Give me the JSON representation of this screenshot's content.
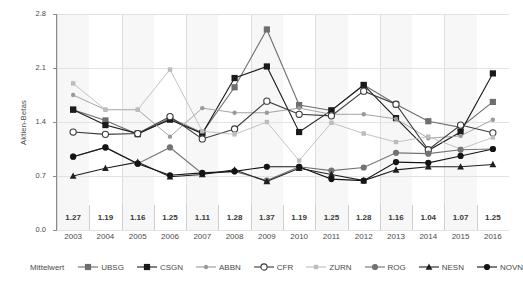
{
  "chart_data": {
    "type": "line",
    "title": "",
    "xlabel": "",
    "ylabel": "Aktien-Betas",
    "ylim": [
      0.0,
      2.8
    ],
    "yticks": [
      "0.0",
      "0.7",
      "1.4",
      "2.1",
      "2.8"
    ],
    "ytick_values": [
      0.0,
      0.7,
      1.4,
      2.1,
      2.8
    ],
    "grid": "horizontal-and-vertical-every-2-years",
    "legend_position": "bottom",
    "categories": [
      "2003",
      "2004",
      "2005",
      "2006",
      "2007",
      "2008",
      "2009",
      "2010",
      "2011",
      "2012",
      "2013",
      "2014",
      "2015",
      "2016"
    ],
    "mean_label": "Mittelwert",
    "mean_values": [
      "1.27",
      "1.19",
      "1.16",
      "1.25",
      "1.11",
      "1.28",
      "1.37",
      "1.19",
      "1.25",
      "1.28",
      "1.16",
      "1.04",
      "1.07",
      "1.25"
    ],
    "series": [
      {
        "name": "UBSG",
        "marker": "square-gray",
        "color": "#6e6e6e",
        "values": [
          1.56,
          1.42,
          1.24,
          1.45,
          1.26,
          1.85,
          2.6,
          1.62,
          1.55,
          1.88,
          1.63,
          1.41,
          1.33,
          1.66
        ]
      },
      {
        "name": "CSGN",
        "marker": "square-black",
        "color": "#1a1a1a",
        "values": [
          1.56,
          1.36,
          1.25,
          1.43,
          1.25,
          1.97,
          2.12,
          1.27,
          1.55,
          1.88,
          1.45,
          1.03,
          1.27,
          2.03
        ]
      },
      {
        "name": "ABBN",
        "marker": "dot-small-gray",
        "color": "#9a9a9a",
        "values": [
          1.75,
          1.56,
          1.56,
          1.21,
          1.58,
          1.52,
          1.52,
          1.58,
          1.5,
          1.5,
          1.44,
          1.19,
          1.22,
          1.43
        ]
      },
      {
        "name": "CFR",
        "marker": "circle-open",
        "color": "#3a3a3a",
        "values": [
          1.27,
          1.24,
          1.25,
          1.47,
          1.18,
          1.31,
          1.67,
          1.5,
          1.48,
          1.8,
          1.63,
          1.04,
          1.36,
          1.26
        ]
      },
      {
        "name": "ZURN",
        "marker": "square-small-lightgray",
        "color": "#bcbcbc",
        "values": [
          1.9,
          1.56,
          1.56,
          2.08,
          1.28,
          1.24,
          1.4,
          0.9,
          1.39,
          1.25,
          1.14,
          1.21,
          1.05,
          1.2
        ]
      },
      {
        "name": "ROG",
        "marker": "dot-gray",
        "color": "#737373",
        "values": [
          0.95,
          1.07,
          0.86,
          1.07,
          0.73,
          0.76,
          0.64,
          0.82,
          0.77,
          0.81,
          1.0,
          0.99,
          1.04,
          1.05
        ]
      },
      {
        "name": "NESN",
        "marker": "triangle-black",
        "color": "#1f1f1f",
        "values": [
          0.7,
          0.8,
          0.88,
          0.69,
          0.72,
          0.78,
          0.63,
          0.8,
          0.72,
          0.64,
          0.78,
          0.82,
          0.82,
          0.85
        ]
      },
      {
        "name": "NOVN",
        "marker": "dot-black",
        "color": "#141414",
        "values": [
          0.95,
          1.07,
          0.86,
          0.71,
          0.74,
          0.76,
          0.82,
          0.82,
          0.66,
          0.64,
          0.88,
          0.87,
          0.96,
          1.05
        ]
      }
    ]
  }
}
